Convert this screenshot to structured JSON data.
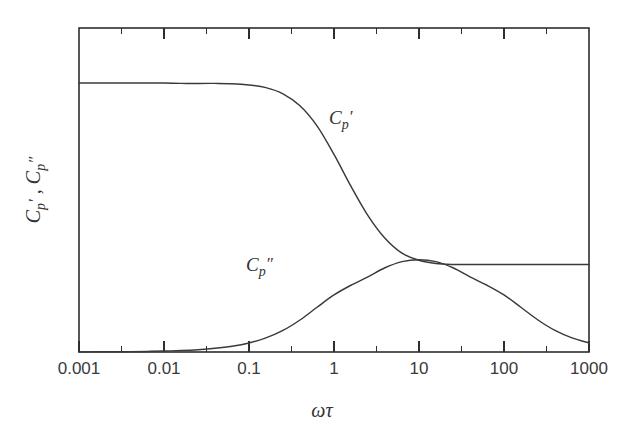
{
  "chart_data": {
    "type": "line",
    "title": "",
    "subtitle": "",
    "xlabel": "ωτ",
    "ylabel": "C ′ , C ″",
    "ylabel_parts": {
      "symbol1": "C",
      "sub1": "p",
      "prime1": "′",
      "separator": " , ",
      "symbol2": "C",
      "sub2": "p",
      "prime2": "″"
    },
    "xscale": "log",
    "yscale": "linear",
    "xlim": [
      0.001,
      1000
    ],
    "ylim": [
      0,
      1
    ],
    "grid": false,
    "legend": "none",
    "x_tick_labels": [
      "0.001",
      "0.01",
      "0.1",
      "1",
      "10",
      "100",
      "1000"
    ],
    "x_tick_values": [
      0.001,
      0.01,
      0.1,
      1,
      10,
      100,
      1000
    ],
    "x_minor_tick_values": [
      0.003,
      0.03,
      0.3,
      3,
      30,
      300
    ],
    "y_tick_labels": [],
    "annotations": [
      {
        "name": "real-part-label",
        "text_symbol": "C",
        "text_sub": "p",
        "text_prime": "′",
        "x": 2.6,
        "y": 0.62
      },
      {
        "name": "imag-part-label",
        "text_symbol": "C",
        "text_sub": "p",
        "text_prime": "″",
        "x": 0.14,
        "y": 0.33
      }
    ],
    "series": [
      {
        "name": "C_p' (real part)",
        "label": "C_p'",
        "description": "Debye real part: falls from high plateau to low plateau around omega*tau = 1",
        "color": "#3a3a3a",
        "plateau_high": 0.83,
        "plateau_low": 0.27,
        "x": [
          0.001,
          0.00158,
          0.00251,
          0.00398,
          0.00631,
          0.01,
          0.0158,
          0.0251,
          0.0398,
          0.0631,
          0.1,
          0.158,
          0.251,
          0.398,
          0.631,
          1.0,
          1.58,
          2.51,
          3.98,
          6.31,
          10.0,
          15.8,
          25.1,
          39.8,
          63.1,
          100.0,
          158.0,
          251.0,
          398.0,
          631.0,
          1000.0
        ],
        "values": [
          0.83,
          0.83,
          0.83,
          0.83,
          0.83,
          0.83,
          0.829,
          0.829,
          0.829,
          0.828,
          0.824,
          0.816,
          0.797,
          0.76,
          0.698,
          0.61,
          0.512,
          0.421,
          0.351,
          0.305,
          0.283,
          0.273,
          0.27,
          0.27,
          0.27,
          0.27,
          0.27,
          0.27,
          0.27,
          0.27,
          0.27
        ]
      },
      {
        "name": "C_p'' (imaginary part)",
        "label": "C_p''",
        "description": "Debye loss peak centred at omega*tau = 1",
        "color": "#3a3a3a",
        "peak_x": 1.0,
        "peak_y": 0.285,
        "baseline": 0.0,
        "x": [
          0.001,
          0.00158,
          0.00251,
          0.00398,
          0.00631,
          0.01,
          0.0158,
          0.0251,
          0.0398,
          0.0631,
          0.1,
          0.158,
          0.251,
          0.398,
          0.631,
          1.0,
          1.58,
          2.51,
          3.98,
          6.31,
          10.0,
          15.8,
          25.1,
          39.8,
          63.1,
          100.0,
          158.0,
          251.0,
          398.0,
          631.0,
          1000.0
        ],
        "values": [
          0.0003,
          0.0005,
          0.0007,
          0.0011,
          0.0018,
          0.0028,
          0.0045,
          0.0071,
          0.0113,
          0.0178,
          0.0279,
          0.0434,
          0.0665,
          0.0988,
          0.138,
          0.176,
          0.206,
          0.232,
          0.26,
          0.279,
          0.285,
          0.279,
          0.26,
          0.232,
          0.206,
          0.176,
          0.138,
          0.0988,
          0.0665,
          0.0434,
          0.0279
        ]
      }
    ]
  },
  "style": {
    "background": "#ffffff",
    "axis_color": "#2e2e2e",
    "curve_color": "#3a3a3a",
    "text_color": "#333333"
  }
}
